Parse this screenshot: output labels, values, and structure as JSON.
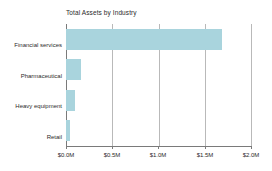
{
  "chart_data": {
    "type": "bar",
    "orientation": "horizontal",
    "title": "Total Assets by Industry",
    "xlabel": "",
    "ylabel": "",
    "categories": [
      "Financial services",
      "Pharmaceutical",
      "Heavy equipment",
      "Retail"
    ],
    "values": [
      1690000,
      160000,
      100000,
      40000
    ],
    "xlim": [
      0,
      2000000
    ],
    "xticks": [
      0,
      500000,
      1000000,
      1500000,
      2000000
    ],
    "xtick_labels": [
      "$0.0M",
      "$0.5M",
      "$1.0M",
      "$1.5M",
      "$2.0M"
    ],
    "grid": "vertical",
    "legend": "none",
    "bar_color": "#a9d4dd",
    "axis_color": "#7a7a7a",
    "gridline_color": "#b9b9b9",
    "text_color": "#2b2b2b",
    "background_color": "#ffffff"
  }
}
